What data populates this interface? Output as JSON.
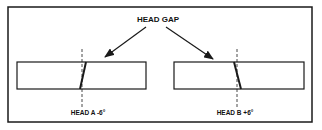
{
  "title": "HEAD GAP",
  "heads": [
    {
      "label": "HEAD A -6°",
      "angle_deg": -6
    },
    {
      "label": "HEAD B +6°",
      "angle_deg": 6
    }
  ],
  "colors": {
    "stroke": "#1a1a1a",
    "background": "#ffffff"
  }
}
